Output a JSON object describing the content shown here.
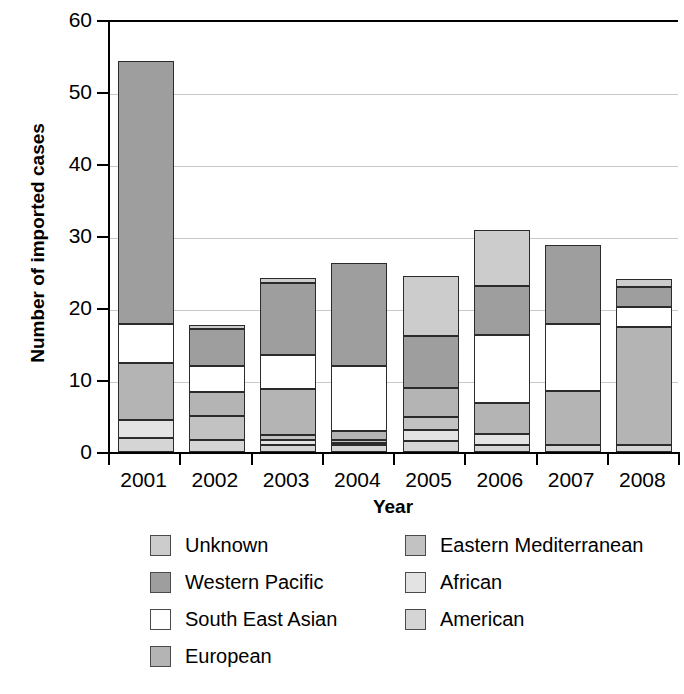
{
  "chart_data": {
    "type": "bar",
    "subtype": "stacked-vertical",
    "title": "",
    "xlabel": "Year",
    "ylabel": "Number of imported cases",
    "categories": [
      "2001",
      "2002",
      "2003",
      "2004",
      "2005",
      "2006",
      "2007",
      "2008"
    ],
    "ylim": [
      0,
      60
    ],
    "yticks": [
      0,
      10,
      20,
      30,
      40,
      50,
      60
    ],
    "ytick_labels": [
      "0",
      "10",
      "20",
      "30",
      "40",
      "50",
      "60"
    ],
    "grid": true,
    "grid_axis": "y",
    "legend_position": "below",
    "stack_order_bottom_to_top": [
      "American",
      "African",
      "Eastern Mediterranean",
      "European",
      "South East Asian",
      "Western Pacific",
      "Unknown"
    ],
    "series": [
      {
        "name": "American",
        "color": "#d5d5d5",
        "values": [
          2.0,
          1.7,
          1.0,
          1.0,
          1.5,
          1.0,
          1.0,
          1.0
        ]
      },
      {
        "name": "African",
        "color": "#e3e3e3",
        "values": [
          2.5,
          0.0,
          0.7,
          0.3,
          1.5,
          1.5,
          0.0,
          0.0
        ]
      },
      {
        "name": "Eastern Mediterranean",
        "color": "#c2c2c2",
        "values": [
          0.0,
          3.3,
          0.7,
          0.4,
          1.8,
          0.0,
          0.0,
          0.0
        ]
      },
      {
        "name": "European",
        "color": "#b4b4b4",
        "values": [
          7.8,
          3.3,
          6.4,
          1.2,
          4.1,
          4.3,
          7.5,
          16.3
        ]
      },
      {
        "name": "South East Asian",
        "color": "#ffffff",
        "values": [
          5.5,
          3.6,
          4.7,
          9.0,
          0.0,
          9.5,
          9.3,
          2.8
        ]
      },
      {
        "name": "Western Pacific",
        "color": "#9e9e9e",
        "values": [
          36.5,
          5.2,
          10.0,
          14.4,
          7.2,
          6.7,
          11.0,
          2.8
        ]
      },
      {
        "name": "Unknown",
        "color": "#cccccc",
        "values": [
          0.0,
          0.5,
          0.7,
          0.0,
          8.4,
          7.8,
          0.0,
          1.2
        ]
      }
    ],
    "totals": [
      54.3,
      17.6,
      24.2,
      26.3,
      24.5,
      30.8,
      28.8,
      24.1
    ]
  },
  "axes": {
    "ylabel": "Number of imported cases",
    "xlabel": "Year",
    "ytick_labels": [
      "60",
      "50",
      "40",
      "30",
      "20",
      "10",
      "0"
    ],
    "xtick_labels": [
      "2001",
      "2002",
      "2003",
      "2004",
      "2005",
      "2006",
      "2007",
      "2008"
    ]
  },
  "legend": {
    "left_column": [
      {
        "label": "Unknown",
        "color": "#cccccc"
      },
      {
        "label": "Western Pacific",
        "color": "#9e9e9e"
      },
      {
        "label": "South East Asian",
        "color": "#ffffff"
      },
      {
        "label": "European",
        "color": "#b4b4b4"
      }
    ],
    "right_column": [
      {
        "label": "Eastern Mediterranean",
        "color": "#c2c2c2"
      },
      {
        "label": "African",
        "color": "#e3e3e3"
      },
      {
        "label": "American",
        "color": "#d5d5d5"
      }
    ]
  },
  "style": {
    "gridline_color": "#c9c9c9",
    "axis_color": "#000000",
    "segment_border_color": "#2b2b2b",
    "background": "#ffffff"
  }
}
